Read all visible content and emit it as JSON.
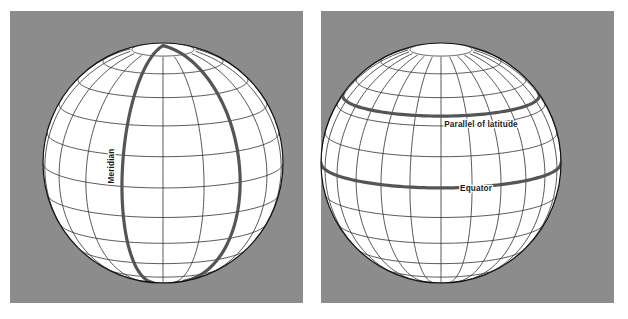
{
  "figure": {
    "background_color": "#ffffff",
    "panel_color": "#8c8c8c",
    "globe_color": "#ffffff",
    "grid_line_color": "#3a3a3a",
    "highlight_line_color": "#555555",
    "outline_color": "#111111",
    "label_color": "#1a1a1a"
  },
  "panels": [
    {
      "id": "left-panel",
      "name": "meridian-panel",
      "x": 10,
      "y": 11,
      "width": 293,
      "height": 292,
      "globe": {
        "cx": 153,
        "cy": 152,
        "r": 120,
        "tilt_deg": 12,
        "meridian_step_deg": 20,
        "parallel_step_deg": 15,
        "highlighted": "meridians"
      },
      "labels": [
        {
          "name": "meridian-label",
          "text": "Meridian",
          "x": 104,
          "y": 155,
          "rotation": -90
        }
      ]
    },
    {
      "id": "right-panel",
      "name": "parallels-panel",
      "x": 321,
      "y": 11,
      "width": 293,
      "height": 292,
      "globe": {
        "cx": 120,
        "cy": 152,
        "r": 120,
        "tilt_deg": 12,
        "meridian_step_deg": 15,
        "parallel_step_deg": 15,
        "highlighted": "parallels"
      },
      "labels": [
        {
          "name": "parallel-of-latitude-label",
          "text": "Parallel of latitude",
          "x": 160,
          "y": 116,
          "rotation": 0
        },
        {
          "name": "equator-label",
          "text": "Equator",
          "x": 155,
          "y": 180,
          "rotation": 0
        }
      ]
    }
  ],
  "chart_data": {
    "type": "diagram",
    "panel_count": 2,
    "annotations": [
      "Meridian",
      "Parallel of latitude",
      "Equator"
    ],
    "graticule": {
      "meridian_spacing_deg": 20,
      "parallel_spacing_deg": 15,
      "highlighted_meridians_count": 2,
      "highlighted_parallels": [
        "Parallel of latitude",
        "Equator"
      ]
    }
  }
}
